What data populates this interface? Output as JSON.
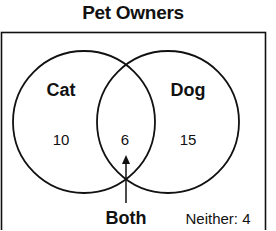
{
  "title": "Pet Owners",
  "sets": [
    {
      "name": "Cat",
      "only_count": "10"
    },
    {
      "name": "Dog",
      "only_count": "15"
    }
  ],
  "intersection": {
    "count": "6",
    "label": "Both"
  },
  "neither": {
    "label": "Neither: 4",
    "count": "4"
  },
  "colors": {
    "stroke": "#111111",
    "background": "#ffffff"
  }
}
